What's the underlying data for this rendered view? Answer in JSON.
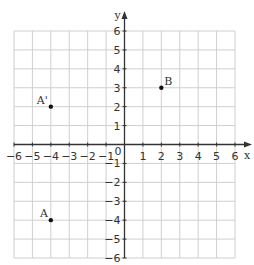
{
  "chart_data": {
    "type": "scatter",
    "title": "",
    "xlabel": "x",
    "ylabel": "y",
    "xlim": [
      -6,
      6
    ],
    "ylim": [
      -6,
      6
    ],
    "grid": true,
    "x_ticks": [
      -6,
      -5,
      -4,
      -3,
      -2,
      -1,
      1,
      2,
      3,
      4,
      5,
      6
    ],
    "y_ticks": [
      -6,
      -5,
      -4,
      -3,
      -2,
      -1,
      1,
      2,
      3,
      4,
      5,
      6
    ],
    "origin_label": "0",
    "points": [
      {
        "label": "A'",
        "x": -4,
        "y": 2
      },
      {
        "label": "B",
        "x": 2,
        "y": 3
      },
      {
        "label": "A",
        "x": -4,
        "y": -4
      }
    ]
  },
  "colors": {
    "grid": "#cfcfcf",
    "axis": "#333333",
    "point": "#111111"
  }
}
